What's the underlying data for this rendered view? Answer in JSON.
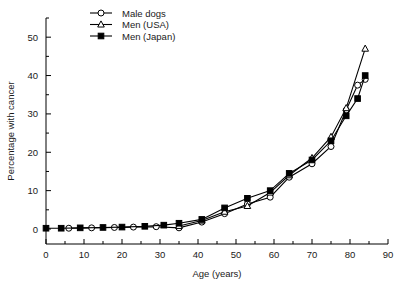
{
  "chart_data": {
    "type": "line",
    "title": "",
    "xlabel": "Age (years)",
    "ylabel": "Percentage with cancer",
    "xlim": [
      0,
      90
    ],
    "ylim": [
      0,
      55
    ],
    "xticks": [
      0,
      10,
      20,
      30,
      40,
      50,
      60,
      70,
      80,
      90
    ],
    "xtick_labels": [
      "0",
      "10",
      "20",
      "30",
      "40",
      "50",
      "60",
      "70",
      "80",
      "90"
    ],
    "xminor_step": 5,
    "yticks": [
      0,
      10,
      20,
      30,
      40,
      50
    ],
    "ytick_labels": [
      "0",
      "10",
      "20",
      "30",
      "40",
      "50"
    ],
    "yminor_step": 5,
    "grid": false,
    "legend_position": "top-left",
    "series": [
      {
        "name": "Male dogs",
        "marker": "open-circle",
        "color": "#000000",
        "points": [
          [
            6,
            0.2
          ],
          [
            12,
            0.3
          ],
          [
            18,
            0.4
          ],
          [
            23,
            0.5
          ],
          [
            29,
            0.6
          ],
          [
            35,
            0.3
          ],
          [
            41,
            1.8
          ],
          [
            47,
            4.0
          ],
          [
            53,
            6.5
          ],
          [
            59,
            8.3
          ],
          [
            64,
            13.5
          ],
          [
            70,
            17.0
          ],
          [
            75,
            21.5
          ],
          [
            79,
            31.0
          ],
          [
            82,
            37.5
          ],
          [
            84,
            39.0
          ]
        ]
      },
      {
        "name": "Men (USA)",
        "marker": "open-triangle",
        "color": "#000000",
        "points": [
          [
            35,
            0.8
          ],
          [
            41,
            2.2
          ],
          [
            47,
            4.5
          ],
          [
            53,
            6.0
          ],
          [
            59,
            9.5
          ],
          [
            64,
            14.0
          ],
          [
            70,
            18.5
          ],
          [
            75,
            24.0
          ],
          [
            79,
            31.5
          ],
          [
            84,
            47.0
          ]
        ]
      },
      {
        "name": "Men (Japan)",
        "marker": "filled-square",
        "color": "#000000",
        "points": [
          [
            0,
            0.2
          ],
          [
            4,
            0.2
          ],
          [
            9,
            0.3
          ],
          [
            15,
            0.4
          ],
          [
            20,
            0.5
          ],
          [
            26,
            0.7
          ],
          [
            31,
            1.0
          ],
          [
            35,
            1.5
          ],
          [
            41,
            2.5
          ],
          [
            47,
            5.5
          ],
          [
            53,
            8.0
          ],
          [
            59,
            10.0
          ],
          [
            64,
            14.5
          ],
          [
            70,
            18.0
          ],
          [
            75,
            23.0
          ],
          [
            79,
            29.5
          ],
          [
            82,
            34.0
          ],
          [
            84,
            40.0
          ]
        ]
      }
    ]
  },
  "legend": {
    "entries": [
      {
        "label": "Male dogs",
        "marker": "open-circle"
      },
      {
        "label": "Men (USA)",
        "marker": "open-triangle"
      },
      {
        "label": "Men (Japan)",
        "marker": "filled-square"
      }
    ]
  }
}
